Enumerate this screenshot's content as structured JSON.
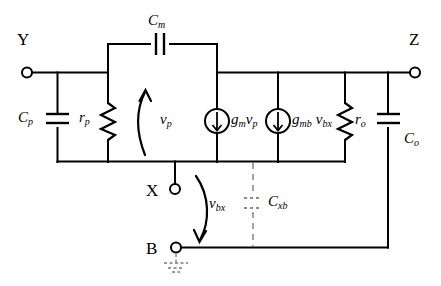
{
  "diagram": {
    "type": "schematic",
    "terminals": [
      {
        "id": "Y",
        "label": "Y",
        "x": 25,
        "y": 72
      },
      {
        "id": "Z",
        "label": "Z",
        "x": 418,
        "y": 72
      },
      {
        "id": "X",
        "label": "X",
        "x": 175,
        "y": 190
      },
      {
        "id": "B",
        "label": "B",
        "x": 175,
        "y": 248
      }
    ],
    "components": [
      {
        "id": "Cp",
        "kind": "capacitor",
        "label": "C",
        "sub": "p"
      },
      {
        "id": "rp",
        "kind": "resistor",
        "label": "r",
        "sub": "p"
      },
      {
        "id": "Cm",
        "kind": "capacitor",
        "label": "C",
        "sub": "m"
      },
      {
        "id": "gmvp",
        "kind": "current-source",
        "label": "g",
        "sub": "m",
        "label2": "v",
        "sub2": "p"
      },
      {
        "id": "gmbvbx",
        "kind": "current-source",
        "label": "g",
        "sub": "mb",
        "label2": "v",
        "sub2": "bx"
      },
      {
        "id": "ro",
        "kind": "resistor",
        "label": "r",
        "sub": "o"
      },
      {
        "id": "Co",
        "kind": "capacitor",
        "label": "C",
        "sub": "o"
      },
      {
        "id": "Cxb",
        "kind": "capacitor-dashed",
        "label": "C",
        "sub": "xb"
      }
    ],
    "voltages": [
      {
        "id": "vp",
        "label": "v",
        "sub": "p",
        "arrow": "up"
      },
      {
        "id": "vbx",
        "label": "v",
        "sub": "bx",
        "arrow": "down"
      }
    ],
    "ground": {
      "id": "gnd-b",
      "style": "dashed"
    }
  },
  "labels": {
    "terminal_y": "Y",
    "terminal_z": "Z",
    "terminal_x": "X",
    "terminal_b": "B",
    "cp_main": "C",
    "cp_sub": "p",
    "rp_main": "r",
    "rp_sub": "p",
    "cm_main": "C",
    "cm_sub": "m",
    "vp_main": "v",
    "vp_sub": "p",
    "gm_main": "g",
    "gm_sub": "m",
    "gm_v_main": "v",
    "gm_v_sub": "p",
    "gmb_main": "g",
    "gmb_sub": "mb",
    "gmb_v_main": "v",
    "gmb_v_sub": "bx",
    "ro_main": "r",
    "ro_sub": "o",
    "co_main": "C",
    "co_sub": "o",
    "vbx_main": "v",
    "vbx_sub": "bx",
    "cxb_main": "C",
    "cxb_sub": "xb"
  },
  "colors": {
    "wire": "#000000",
    "background": "#ffffff",
    "dashed": "#8a8a8a",
    "ground": "#9a9a9a"
  }
}
